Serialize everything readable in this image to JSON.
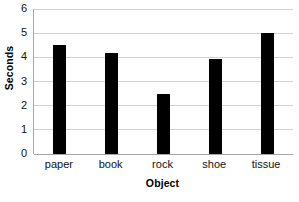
{
  "chart_data": {
    "type": "bar",
    "title": "",
    "title_cropped": true,
    "categories": [
      "paper",
      "book",
      "rock",
      "shoe",
      "tissue"
    ],
    "values": [
      4.5,
      4.2,
      2.5,
      3.95,
      5.0
    ],
    "xlabel": "Object",
    "ylabel": "Seconds",
    "ylim": [
      0,
      6
    ],
    "y_ticks": [
      "6",
      "5",
      "4",
      "3",
      "2",
      "1",
      "0"
    ],
    "y_tick_values": [
      6,
      5,
      4,
      3,
      2,
      1,
      0
    ],
    "grid": "horizontal",
    "legend": "none",
    "bar_color": "#000000",
    "gridline_color": "#d0d0d0",
    "axis_color": "#a6a6a6",
    "background_color": "#ffffff"
  }
}
